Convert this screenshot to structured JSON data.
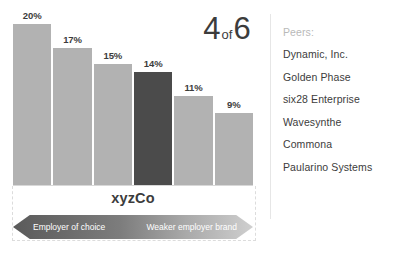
{
  "chart_data": {
    "type": "bar",
    "title": "",
    "xlabel": "",
    "ylabel": "",
    "categories": [
      "bar-1",
      "bar-2",
      "bar-3",
      "xyzCo",
      "bar-5",
      "bar-6"
    ],
    "values": [
      20,
      17,
      15,
      14,
      11,
      9
    ],
    "value_labels": [
      "20%",
      "17%",
      "15%",
      "14%",
      "11%",
      "9%"
    ],
    "highlight_index": 3,
    "highlight_label": "xyzCo",
    "ylim": [
      0,
      22
    ],
    "grid": false,
    "legend": "none",
    "colors": {
      "bar": "#b2b2b2",
      "highlight_bar": "#4b4b4b",
      "text": "#3c3c3c",
      "muted_text": "#b9b9b9",
      "divider": "#e6e6e6"
    }
  },
  "headline": {
    "rank": "4",
    "connector": "of",
    "total": "6"
  },
  "company": {
    "label": "xyzCo"
  },
  "scale": {
    "left_label": "Employer of choice",
    "right_label": "Weaker employer brand"
  },
  "peers": {
    "title": "Peers:",
    "items": [
      {
        "name": "Dynamic, Inc."
      },
      {
        "name": "Golden Phase"
      },
      {
        "name": "six28 Enterprise"
      },
      {
        "name": "Wavesynthe"
      },
      {
        "name": "Commona"
      },
      {
        "name": "Paularino Systems"
      }
    ]
  }
}
